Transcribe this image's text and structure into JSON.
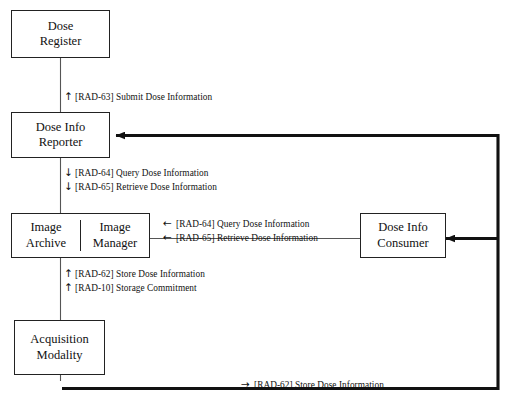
{
  "diagram": {
    "type": "flow-diagram",
    "background_color": "#ffffff",
    "line_color": "#222222",
    "nodes": [
      {
        "id": "dose-register",
        "label_line1": "Dose",
        "label_line2": "Register"
      },
      {
        "id": "dose-info-reporter",
        "label_line1": "Dose Info",
        "label_line2": "Reporter"
      },
      {
        "id": "image-archive",
        "label_line1": "Image",
        "label_line2": "Archive"
      },
      {
        "id": "image-manager",
        "label_line1": "Image",
        "label_line2": "Manager"
      },
      {
        "id": "acquisition-modality",
        "label_line1": "Acquisition",
        "label_line2": "Modality"
      },
      {
        "id": "dose-info-consumer",
        "label_line1": "Dose Info",
        "label_line2": "Consumer"
      }
    ],
    "edge_labels": {
      "submit_dose": {
        "arrow": "↑",
        "text": "[RAD-63] Submit Dose Information"
      },
      "query_dose_down": {
        "arrow": "↓",
        "text": "[RAD-64] Query Dose Information"
      },
      "retrieve_dose_down": {
        "arrow": "↓",
        "text": "[RAD-65] Retrieve Dose Information"
      },
      "query_dose_left": {
        "arrow": "←",
        "text": "[RAD-64] Query Dose Information"
      },
      "retrieve_dose_left": {
        "arrow": "←",
        "text": "[RAD-65] Retrieve Dose Information"
      },
      "store_dose_up": {
        "arrow": "↑",
        "text": "[RAD-62] Store Dose Information"
      },
      "storage_commitment_up": {
        "arrow": "↑",
        "text": "[RAD-10] Storage Commitment"
      },
      "store_dose_right": {
        "arrow": "→",
        "text": "[RAD-62] Store Dose Information"
      }
    }
  }
}
